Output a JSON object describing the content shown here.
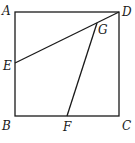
{
  "diagram": {
    "type": "geometry",
    "shape": "square ABCD",
    "points": {
      "A": {
        "label": "A",
        "x": 15,
        "y": 12
      },
      "B": {
        "label": "B",
        "x": 15,
        "y": 116
      },
      "C": {
        "label": "C",
        "x": 119,
        "y": 116
      },
      "D": {
        "label": "D",
        "x": 119,
        "y": 12
      },
      "E": {
        "label": "E",
        "x": 15,
        "y": 63
      },
      "F": {
        "label": "F",
        "x": 67,
        "y": 116
      },
      "G": {
        "label": "G",
        "x": 97,
        "y": 23
      }
    },
    "segments": [
      "AB",
      "BC",
      "CD",
      "DA",
      "ED",
      "FG"
    ],
    "line_color": "#1a1a1a"
  }
}
